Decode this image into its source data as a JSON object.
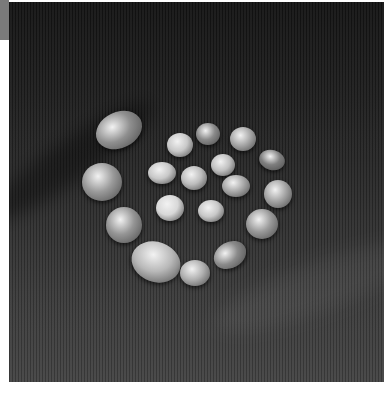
{
  "image": {
    "description": "Grayscale photograph of tumbled polished stones arranged in a spiral on dark ribbed fabric",
    "background_color": "#2a2a2a",
    "frame_color": "#ffffff",
    "tab_color": "#7a7a7a",
    "stone_count": 17
  },
  "stones": [
    {
      "x": 95,
      "y": 112,
      "w": 48,
      "h": 36,
      "rot": -25,
      "tone": "#8f8f8f"
    },
    {
      "x": 82,
      "y": 163,
      "w": 40,
      "h": 38,
      "rot": 0,
      "tone": "#9a9a9a"
    },
    {
      "x": 106,
      "y": 207,
      "w": 36,
      "h": 36,
      "rot": 0,
      "tone": "#959595"
    },
    {
      "x": 131,
      "y": 242,
      "w": 50,
      "h": 40,
      "rot": 20,
      "tone": "#b8b8b8"
    },
    {
      "x": 180,
      "y": 260,
      "w": 30,
      "h": 26,
      "rot": 0,
      "tone": "#b0b0b0"
    },
    {
      "x": 213,
      "y": 242,
      "w": 34,
      "h": 26,
      "rot": -30,
      "tone": "#8a8a8a"
    },
    {
      "x": 246,
      "y": 209,
      "w": 32,
      "h": 30,
      "rot": 0,
      "tone": "#9a9a9a"
    },
    {
      "x": 264,
      "y": 180,
      "w": 28,
      "h": 28,
      "rot": 0,
      "tone": "#a5a5a5"
    },
    {
      "x": 259,
      "y": 150,
      "w": 26,
      "h": 20,
      "rot": 15,
      "tone": "#7e7e7e"
    },
    {
      "x": 230,
      "y": 127,
      "w": 26,
      "h": 24,
      "rot": 0,
      "tone": "#a8a8a8"
    },
    {
      "x": 196,
      "y": 123,
      "w": 24,
      "h": 22,
      "rot": 0,
      "tone": "#8a8a8a"
    },
    {
      "x": 167,
      "y": 133,
      "w": 26,
      "h": 24,
      "rot": 0,
      "tone": "#c8c8c8"
    },
    {
      "x": 148,
      "y": 162,
      "w": 28,
      "h": 22,
      "rot": 0,
      "tone": "#c8c8c8"
    },
    {
      "x": 181,
      "y": 166,
      "w": 26,
      "h": 24,
      "rot": 0,
      "tone": "#bdbdbd"
    },
    {
      "x": 211,
      "y": 154,
      "w": 24,
      "h": 22,
      "rot": 0,
      "tone": "#c0c0c0"
    },
    {
      "x": 222,
      "y": 175,
      "w": 28,
      "h": 22,
      "rot": 0,
      "tone": "#a8a8a8"
    },
    {
      "x": 156,
      "y": 195,
      "w": 28,
      "h": 26,
      "rot": 0,
      "tone": "#d8d8d8"
    },
    {
      "x": 198,
      "y": 200,
      "w": 26,
      "h": 22,
      "rot": 0,
      "tone": "#c8c8c8"
    }
  ]
}
